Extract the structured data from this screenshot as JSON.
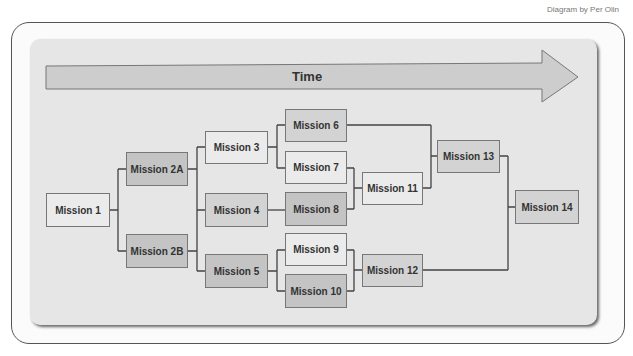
{
  "credit": "Diagram by Per Olin",
  "timeline": {
    "label": "Time"
  },
  "missions": {
    "m1": "Mission 1",
    "m2a": "Mission 2A",
    "m2b": "Mission 2B",
    "m3": "Mission 3",
    "m4": "Mission 4",
    "m5": "Mission 5",
    "m6": "Mission 6",
    "m7": "Mission 7",
    "m8": "Mission 8",
    "m9": "Mission 9",
    "m10": "Mission 10",
    "m11": "Mission 11",
    "m12": "Mission 12",
    "m13": "Mission 13",
    "m14": "Mission 14"
  },
  "connections": [
    [
      "Mission 1",
      "Mission 2A"
    ],
    [
      "Mission 1",
      "Mission 2B"
    ],
    [
      "Mission 2A",
      "Mission 3"
    ],
    [
      "Mission 2A",
      "Mission 4"
    ],
    [
      "Mission 2B",
      "Mission 4"
    ],
    [
      "Mission 2B",
      "Mission 5"
    ],
    [
      "Mission 3",
      "Mission 6"
    ],
    [
      "Mission 3",
      "Mission 7"
    ],
    [
      "Mission 4",
      "Mission 8"
    ],
    [
      "Mission 5",
      "Mission 9"
    ],
    [
      "Mission 5",
      "Mission 10"
    ],
    [
      "Mission 7",
      "Mission 11"
    ],
    [
      "Mission 8",
      "Mission 11"
    ],
    [
      "Mission 9",
      "Mission 12"
    ],
    [
      "Mission 10",
      "Mission 12"
    ],
    [
      "Mission 6",
      "Mission 13"
    ],
    [
      "Mission 11",
      "Mission 13"
    ],
    [
      "Mission 13",
      "Mission 14"
    ],
    [
      "Mission 12",
      "Mission 14"
    ]
  ]
}
